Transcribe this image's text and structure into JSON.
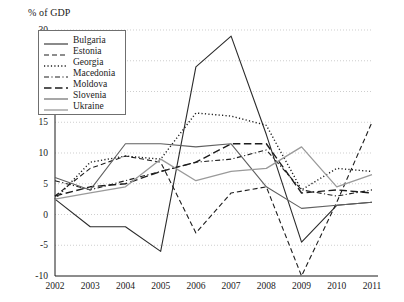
{
  "chart_data": {
    "type": "line",
    "title": "",
    "subtitle": "",
    "ylabel": "% of GDP",
    "xlabel": "",
    "ylim": [
      -10,
      30
    ],
    "xlim": [
      2002,
      2011
    ],
    "grid": "horizontal-dotted",
    "legend_position": "top-left-inside",
    "y_ticks": [
      "30",
      "25",
      "20",
      "15",
      "10",
      "5",
      "0",
      "-5",
      "-10"
    ],
    "y_tick_values": [
      30,
      25,
      20,
      15,
      10,
      5,
      0,
      -5,
      -10
    ],
    "categories": [
      "2002",
      "2003",
      "2004",
      "2005",
      "2006",
      "2007",
      "2008",
      "2009",
      "2010",
      "2011"
    ],
    "x": [
      2002,
      2003,
      2004,
      2005,
      2006,
      2007,
      2008,
      2009,
      2010,
      2011
    ],
    "series": [
      {
        "name": "Bulgaria",
        "style": "solid",
        "color": "#2b2b2b",
        "width": 1.1,
        "values": [
          2.5,
          -2.0,
          -2.0,
          -6.0,
          24.0,
          29.0,
          13.0,
          -4.5,
          1.5,
          2.0
        ]
      },
      {
        "name": "Estonia",
        "style": "dashed",
        "color": "#1d1d1d",
        "width": 1.1,
        "values": [
          3.0,
          7.5,
          9.5,
          8.5,
          -3.0,
          3.5,
          4.5,
          -10.0,
          2.0,
          15.0
        ]
      },
      {
        "name": "Georgia",
        "style": "dotted",
        "color": "#1d1d1d",
        "width": 1.4,
        "values": [
          2.5,
          8.5,
          9.5,
          9.0,
          16.5,
          16.0,
          14.5,
          4.0,
          7.5,
          7.0
        ]
      },
      {
        "name": "Macedonia",
        "style": "dash-dot",
        "color": "#1d1d1d",
        "width": 1.1,
        "values": [
          5.5,
          4.0,
          5.5,
          7.0,
          8.5,
          9.0,
          10.5,
          4.0,
          3.0,
          4.0
        ]
      },
      {
        "name": "Moldova",
        "style": "long-dash",
        "color": "#1d1d1d",
        "width": 1.4,
        "values": [
          3.0,
          4.5,
          5.0,
          7.0,
          8.5,
          11.5,
          11.5,
          3.5,
          4.0,
          3.5
        ]
      },
      {
        "name": "Slovenia",
        "style": "solid",
        "color": "#606060",
        "width": 1.1,
        "values": [
          6.0,
          4.0,
          11.5,
          11.5,
          11.0,
          11.5,
          4.5,
          1.0,
          1.5,
          2.0
        ]
      },
      {
        "name": "Ukraine",
        "style": "solid",
        "color": "#9a9a9a",
        "width": 1.3,
        "values": [
          2.5,
          3.5,
          4.5,
          9.0,
          5.5,
          7.0,
          7.5,
          11.0,
          4.5,
          6.5
        ]
      }
    ]
  },
  "axis": {
    "y_title": "% of GDP"
  }
}
